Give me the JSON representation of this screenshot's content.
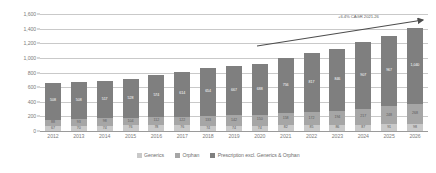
{
  "chart_data": {
    "type": "bar",
    "stacked": true,
    "title": "",
    "subtitle": "",
    "xlabel": "",
    "ylabel": "",
    "ylim": [
      0,
      1600
    ],
    "ytick_values": [
      0,
      200,
      400,
      600,
      800,
      1000,
      1200,
      1400,
      1600
    ],
    "ytick_labels": [
      "0",
      "200",
      "400",
      "600",
      "800",
      "1,000",
      "1,200",
      "1,400",
      "1,600"
    ],
    "grid": true,
    "legend_position": "bottom",
    "categories": [
      "2012",
      "2013",
      "2014",
      "2015",
      "2016",
      "2017",
      "2018",
      "2019",
      "2020",
      "2021",
      "2022",
      "2023",
      "2024",
      "2025",
      "2026"
    ],
    "series": [
      {
        "name": "Prescription excl. Generics & Orphan",
        "color": "#7f7f7f",
        "values": [
          508,
          508,
          517,
          528,
          574,
          614,
          654,
          667,
          688,
          756,
          817,
          846,
          907,
          967,
          1040
        ],
        "labels": [
          "508",
          "508",
          "517",
          "528",
          "574",
          "614",
          "654",
          "667",
          "688",
          "756",
          "817",
          "846",
          "907",
          "967",
          "1,040"
        ]
      },
      {
        "name": "Orphan",
        "color": "#a6a6a6",
        "values": [
          88,
          93,
          98,
          104,
          112,
          122,
          133,
          142,
          150,
          158,
          172,
          194,
          217,
          248,
          268
        ],
        "labels": [
          "88",
          "93",
          "98",
          "104",
          "112",
          "122",
          "133",
          "142",
          "150",
          "158",
          "172",
          "194",
          "217",
          "248",
          "268"
        ]
      },
      {
        "name": "Generics",
        "color": "#c9c9c9",
        "values": [
          67,
          70,
          74,
          76,
          78,
          76,
          74,
          74,
          74,
          82,
          85,
          86,
          87,
          91,
          98
        ],
        "labels": [
          "67",
          "70",
          "74",
          "76",
          "78",
          "76",
          "74",
          "74",
          "74",
          "82",
          "85",
          "86",
          "87",
          "91",
          "98"
        ]
      }
    ],
    "totals": [
      663,
      671,
      689,
      708,
      764,
      812,
      861,
      883,
      912,
      996,
      1074,
      1126,
      1211,
      1306,
      1406
    ],
    "annotations": [
      {
        "name": "cagr-callout",
        "text": "+6.4% CAGR 2021-26",
        "arrow": true
      }
    ]
  },
  "legend": {
    "items": [
      {
        "label": "Generics",
        "swatch_class": "sw-gen"
      },
      {
        "label": "Orphan",
        "swatch_class": "sw-orphan"
      },
      {
        "label": "Prescription excl. Generics & Orphan",
        "swatch_class": "sw-presc"
      }
    ]
  }
}
